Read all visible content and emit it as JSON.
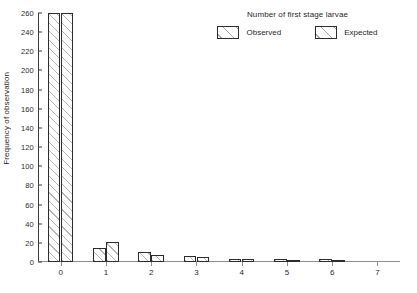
{
  "chart_data": {
    "type": "bar",
    "title": "",
    "legend_title": "Number of first stage larvae",
    "xlabel": "",
    "ylabel": "Frequency of observation",
    "categories": [
      "0",
      "1",
      "2",
      "3",
      "4",
      "5",
      "6",
      "7"
    ],
    "series": [
      {
        "name": "Observed",
        "values": [
          260,
          15,
          10,
          6,
          3,
          3,
          3,
          0
        ]
      },
      {
        "name": "Expected",
        "values": [
          260,
          21,
          7,
          5,
          3,
          2,
          1,
          0
        ]
      }
    ],
    "ylim": [
      0,
      260
    ],
    "yticks": [
      0,
      20,
      40,
      60,
      80,
      100,
      120,
      140,
      160,
      180,
      200,
      220,
      240,
      260
    ],
    "xticks": [
      "0",
      "1",
      "2",
      "3",
      "4",
      "5",
      "6",
      "7"
    ],
    "legend_position": "top-right",
    "grid": false,
    "colors": {
      "bar_outline": "#2c2c2c",
      "bar_fill": "#ffffff",
      "hatch": "#787878",
      "axis": "#3a3a3a",
      "text": "#1f1f1f"
    }
  }
}
